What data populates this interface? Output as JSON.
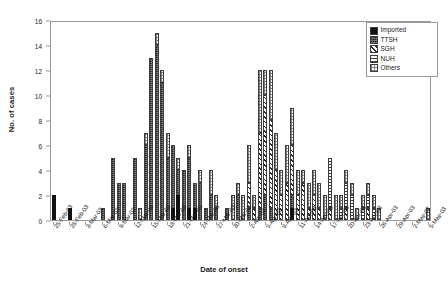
{
  "chart_data": {
    "type": "bar",
    "title": "",
    "xlabel": "Date of onset",
    "ylabel": "No. of cases",
    "ylim": [
      0,
      16
    ],
    "yticks": [
      0,
      2,
      4,
      6,
      8,
      10,
      12,
      14,
      16
    ],
    "grid": false,
    "stacked": true,
    "legend_position": "top-right",
    "legend": [
      "Imported",
      "TTSH",
      "SGH",
      "NUH",
      "Others"
    ],
    "series_colors": {
      "Imported": "#111111",
      "TTSH": "#4d4d4d",
      "SGH": "#2b2b2b",
      "NUH": "#3a3a3a",
      "Others": "#6e6e6e"
    },
    "tick_labels": [
      "25-Feb-03",
      "28-Feb-03",
      "3-Mar-03",
      "6-Mar-03",
      "9-Mar-03",
      "12-Mar-03",
      "15-Mar-03",
      "18-Mar-03",
      "21-Mar-03",
      "24-Mar-03",
      "27-Mar-03",
      "30-Mar-03",
      "2-Apr-03",
      "5-Apr-03",
      "8-Apr-03",
      "11-Apr-03",
      "14-Apr-03",
      "17-Apr-03",
      "20-Apr-03",
      "23-Apr-03",
      "26-Apr-03",
      "29-Apr-03",
      "2-May-03",
      "5-May-03"
    ],
    "tick_every": 3,
    "categories": [
      "25-Feb-03",
      "26-Feb-03",
      "27-Feb-03",
      "28-Feb-03",
      "1-Mar-03",
      "2-Mar-03",
      "3-Mar-03",
      "4-Mar-03",
      "5-Mar-03",
      "6-Mar-03",
      "7-Mar-03",
      "8-Mar-03",
      "9-Mar-03",
      "10-Mar-03",
      "11-Mar-03",
      "12-Mar-03",
      "13-Mar-03",
      "14-Mar-03",
      "15-Mar-03",
      "16-Mar-03",
      "17-Mar-03",
      "18-Mar-03",
      "19-Mar-03",
      "20-Mar-03",
      "21-Mar-03",
      "22-Mar-03",
      "23-Mar-03",
      "24-Mar-03",
      "25-Mar-03",
      "26-Mar-03",
      "27-Mar-03",
      "28-Mar-03",
      "29-Mar-03",
      "30-Mar-03",
      "31-Mar-03",
      "1-Apr-03",
      "2-Apr-03",
      "3-Apr-03",
      "4-Apr-03",
      "5-Apr-03",
      "6-Apr-03",
      "7-Apr-03",
      "8-Apr-03",
      "9-Apr-03",
      "10-Apr-03",
      "11-Apr-03",
      "12-Apr-03",
      "13-Apr-03",
      "14-Apr-03",
      "15-Apr-03",
      "16-Apr-03",
      "17-Apr-03",
      "18-Apr-03",
      "19-Apr-03",
      "20-Apr-03",
      "21-Apr-03",
      "22-Apr-03",
      "23-Apr-03",
      "24-Apr-03",
      "25-Apr-03",
      "26-Apr-03",
      "27-Apr-03",
      "28-Apr-03",
      "29-Apr-03",
      "30-Apr-03",
      "1-May-03",
      "2-May-03",
      "3-May-03",
      "4-May-03",
      "5-May-03"
    ],
    "series": [
      {
        "name": "Imported",
        "values": [
          2,
          0,
          0,
          1,
          0,
          0,
          0,
          0,
          0,
          0,
          0,
          0,
          0,
          0,
          0,
          0,
          0,
          0,
          0,
          0,
          0,
          0,
          1,
          2,
          0,
          1,
          1,
          0,
          0,
          0,
          0,
          0,
          0,
          0,
          0,
          0,
          0,
          0,
          0,
          0,
          0,
          0,
          0,
          0,
          1,
          0,
          0,
          0,
          0,
          0,
          0,
          0,
          0,
          0,
          0,
          0,
          0,
          0,
          0,
          0,
          0,
          0,
          0,
          0,
          0,
          0,
          0,
          0,
          0,
          0
        ]
      },
      {
        "name": "TTSH",
        "values": [
          0,
          0,
          0,
          0,
          0,
          0,
          0,
          0,
          0,
          1,
          0,
          5,
          3,
          3,
          0,
          5,
          0,
          6,
          13,
          14,
          11,
          5,
          5,
          2,
          4,
          4,
          2,
          3,
          1,
          2,
          1,
          0,
          1,
          0,
          2,
          0,
          1,
          0,
          1,
          2,
          1,
          0,
          0,
          0,
          1,
          0,
          0,
          0,
          0,
          0,
          0,
          0,
          0,
          0,
          0,
          0,
          0,
          0,
          0,
          0,
          0,
          0,
          0,
          0,
          0,
          0,
          0,
          0,
          0,
          0
        ]
      },
      {
        "name": "SGH",
        "values": [
          0,
          0,
          0,
          0,
          0,
          0,
          0,
          0,
          0,
          0,
          0,
          0,
          0,
          0,
          0,
          0,
          0,
          0,
          0,
          0,
          0,
          0,
          0,
          0,
          0,
          0,
          0,
          0,
          0,
          0,
          0,
          0,
          0,
          0,
          0,
          0,
          2,
          1,
          6,
          8,
          7,
          4,
          2,
          3,
          4,
          2,
          3,
          1,
          2,
          1,
          0,
          1,
          0,
          0,
          1,
          0,
          0,
          0,
          1,
          0,
          0,
          0,
          0,
          0,
          0,
          0,
          0,
          0,
          0,
          0
        ]
      },
      {
        "name": "NUH",
        "values": [
          0,
          0,
          0,
          0,
          0,
          0,
          0,
          0,
          0,
          0,
          0,
          0,
          0,
          0,
          0,
          0,
          0,
          0,
          0,
          0,
          0,
          0,
          0,
          0,
          0,
          0,
          0,
          0,
          0,
          0,
          0,
          0,
          0,
          0,
          0,
          0,
          0,
          0,
          0,
          0,
          0,
          0,
          0,
          0,
          0,
          0,
          0,
          0,
          0,
          0,
          0,
          4,
          0,
          1,
          2,
          2,
          0,
          1,
          1,
          1,
          0,
          0,
          0,
          0,
          0,
          0,
          0,
          0,
          0,
          0
        ]
      },
      {
        "name": "Others",
        "values": [
          0,
          0,
          0,
          0,
          0,
          0,
          0,
          0,
          0,
          0,
          0,
          0,
          0,
          0,
          0,
          0,
          1,
          1,
          0,
          1,
          1,
          2,
          0,
          1,
          0,
          1,
          0,
          1,
          0,
          2,
          1,
          0,
          0,
          2,
          1,
          2,
          3,
          1,
          5,
          2,
          4,
          3,
          2,
          3,
          3,
          2,
          1,
          2,
          2,
          2,
          2,
          0,
          2,
          1,
          1,
          1,
          1,
          1,
          1,
          1,
          1,
          0,
          0,
          0,
          0,
          0,
          0,
          0,
          0,
          1
        ]
      }
    ]
  }
}
